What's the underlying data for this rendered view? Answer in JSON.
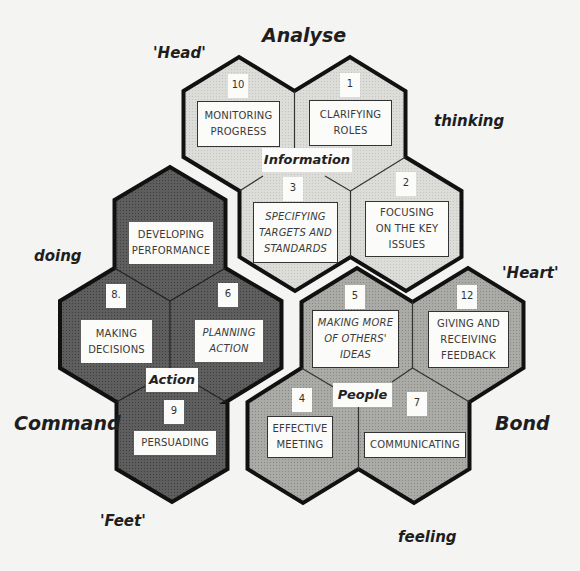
{
  "outer_labels": {
    "analyse": "Analyse",
    "head": "'Head'",
    "thinking": "thinking",
    "doing": "doing",
    "heart": "'Heart'",
    "command": "Command",
    "bond": "Bond",
    "feet": "'Feet'",
    "feeling": "feeling"
  },
  "colors": {
    "information_fill": "#d9d9d6",
    "action_fill": "#5a5a5a",
    "people_fill": "#a6a6a3",
    "outline": "#111111",
    "box_fill": "#fbfbf9",
    "background": "#f4f4f2"
  },
  "clusters": {
    "information": {
      "label": "Information",
      "hexes": [
        {
          "number": "10",
          "text": "MONITORING PROGRESS",
          "lines": [
            "MONITORING",
            "PROGRESS"
          ],
          "italic": false
        },
        {
          "number": "1",
          "text": "CLARIFYING ROLES",
          "lines": [
            "CLARIFYING",
            "ROLES"
          ],
          "italic": false
        },
        {
          "number": "3",
          "text": "SPECIFYING TARGETS AND STANDARDS",
          "lines": [
            "SPECIFYING",
            "TARGETS AND",
            "STANDARDS"
          ],
          "italic": true
        },
        {
          "number": "2",
          "text": "FOCUSING ON THE KEY ISSUES",
          "lines": [
            "FOCUSING",
            "ON THE KEY",
            "ISSUES"
          ],
          "italic": false
        }
      ]
    },
    "action": {
      "label": "Action",
      "hexes": [
        {
          "number": "",
          "text": "DEVELOPING PERFORMANCE",
          "lines": [
            "DEVELOPING",
            "PERFORMANCE"
          ],
          "italic": false
        },
        {
          "number": "8.",
          "text": "MAKING DECISIONS",
          "lines": [
            "MAKING",
            "DECISIONS"
          ],
          "italic": false
        },
        {
          "number": "6",
          "text": "PLANNING ACTION",
          "lines": [
            "PLANNING",
            "ACTION"
          ],
          "italic": true
        },
        {
          "number": "9",
          "text": "PERSUADING",
          "lines": [
            "PERSUADING"
          ],
          "italic": false
        }
      ]
    },
    "people": {
      "label": "People",
      "hexes": [
        {
          "number": "5",
          "text": "MAKING MORE OF OTHERS' IDEAS",
          "lines": [
            "MAKING MORE",
            "OF OTHERS'",
            "IDEAS"
          ],
          "italic": true
        },
        {
          "number": "12",
          "text": "GIVING AND RECEIVING FEEDBACK",
          "lines": [
            "GIVING AND",
            "RECEIVING",
            "FEEDBACK"
          ],
          "italic": false
        },
        {
          "number": "4",
          "text": "EFFECTIVE MEETING",
          "lines": [
            "EFFECTIVE",
            "MEETING"
          ],
          "italic": false
        },
        {
          "number": "7",
          "text": "COMMUNICATING",
          "lines": [
            "COMMUNICATING"
          ],
          "italic": false
        }
      ]
    }
  }
}
